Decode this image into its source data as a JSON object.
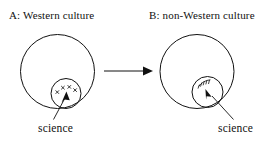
{
  "figure": {
    "type": "diagram",
    "background_color": "#ffffff",
    "ink_color": "#111111",
    "panels": [
      {
        "id": "A",
        "title": "A: Western culture",
        "outer_shape": "circle",
        "inner_shape": "circle",
        "inner_label": "science",
        "inner_contents": "x-marks",
        "inner_mark_count": 4,
        "inner_position": "tangent inside bottom of outer circle"
      },
      {
        "id": "B",
        "title": "B: non-Western culture",
        "outer_shape": "circle",
        "inner_shape": "circle",
        "inner_label": "science",
        "inner_contents": "hatching",
        "inner_position": "straddling lower-right boundary of outer circle"
      }
    ],
    "connector": {
      "name": "transfer-arrow",
      "direction": "left-to-right",
      "from_panel": "A",
      "to_panel": "B"
    }
  }
}
